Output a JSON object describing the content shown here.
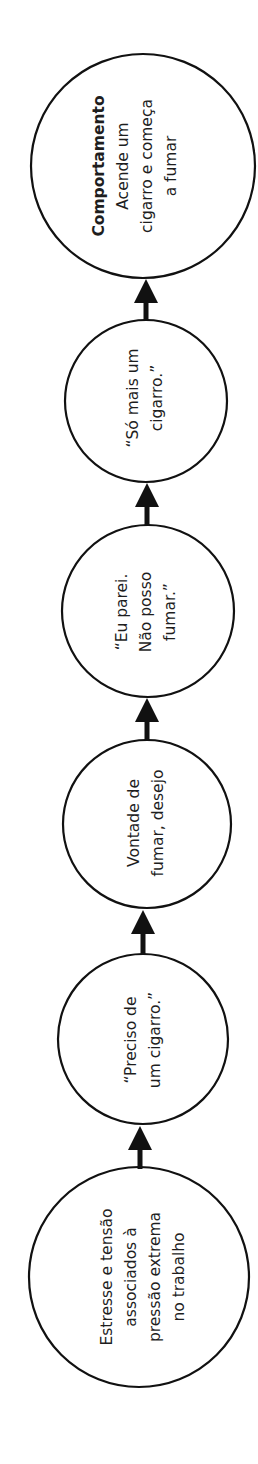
{
  "diagram": {
    "type": "flow-chain",
    "orientation": "rotated-90-ccw",
    "direction": "bottom-to-top",
    "stroke_color": "#111111",
    "fill_color": "#ffffff",
    "nodes": [
      {
        "id": "behavior",
        "title": "Comportamento",
        "lines": [
          "Acende um",
          "cigarro e começa",
          "a fumar"
        ]
      },
      {
        "id": "thought-one-more",
        "lines": [
          "“Só mais um",
          "cigarro.”"
        ]
      },
      {
        "id": "thought-quit",
        "lines": [
          "“Eu parei.",
          "Não posso",
          "fumar.”"
        ]
      },
      {
        "id": "craving",
        "lines": [
          "Vontade de",
          "fumar, desejo"
        ]
      },
      {
        "id": "thought-need",
        "lines": [
          "“Preciso de",
          "um cigarro.”"
        ]
      },
      {
        "id": "trigger",
        "lines": [
          "Estresse e tensão",
          "associados à",
          "pressão extrema",
          "no trabalho"
        ]
      }
    ],
    "edges": [
      {
        "from": "trigger",
        "to": "thought-need"
      },
      {
        "from": "thought-need",
        "to": "craving"
      },
      {
        "from": "craving",
        "to": "thought-quit"
      },
      {
        "from": "thought-quit",
        "to": "thought-one-more"
      },
      {
        "from": "thought-one-more",
        "to": "behavior"
      }
    ]
  }
}
